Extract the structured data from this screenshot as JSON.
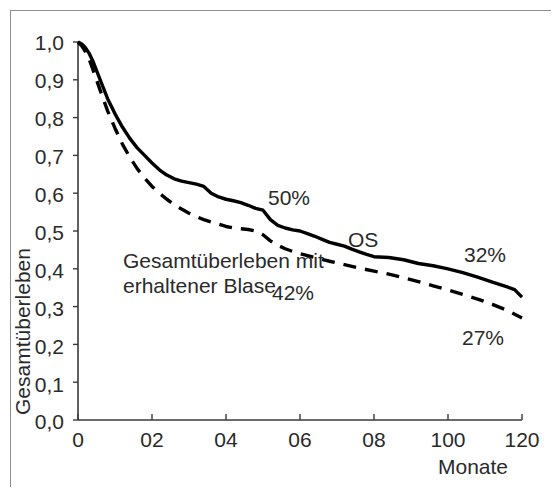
{
  "chart_data": {
    "type": "line",
    "title": "",
    "xlabel": "Monate",
    "ylabel": "Gesamtüberleben",
    "xlim": [
      0,
      120
    ],
    "ylim": [
      0.0,
      1.0
    ],
    "grid": false,
    "legend_position": "inline-annotations",
    "x_tick_labels": [
      "0",
      "02",
      "04",
      "06",
      "08",
      "100",
      "120"
    ],
    "x_tick_values": [
      0,
      20,
      40,
      60,
      80,
      100,
      120
    ],
    "y_tick_labels": [
      "1,0",
      "0,9",
      "0,8",
      "0,7",
      "0,6",
      "0,5",
      "0,4",
      "0,3",
      "0,2",
      "0,1",
      "0,0"
    ],
    "y_tick_values": [
      1.0,
      0.9,
      0.8,
      0.7,
      0.6,
      0.5,
      0.4,
      0.3,
      0.2,
      0.1,
      0.0
    ],
    "series": [
      {
        "name": "OS",
        "style": "solid",
        "color": "#000000",
        "x": [
          0,
          1,
          2,
          3,
          4,
          5,
          6,
          7,
          8,
          10,
          12,
          14,
          16,
          18,
          20,
          22,
          24,
          26,
          28,
          30,
          32,
          34,
          36,
          38,
          40,
          42,
          44,
          46,
          48,
          50,
          52,
          54,
          56,
          58,
          60,
          62,
          64,
          66,
          68,
          70,
          72,
          74,
          76,
          78,
          80,
          84,
          88,
          92,
          96,
          100,
          104,
          108,
          112,
          116,
          118,
          120
        ],
        "y": [
          1.0,
          0.995,
          0.985,
          0.97,
          0.95,
          0.925,
          0.9,
          0.875,
          0.85,
          0.81,
          0.775,
          0.745,
          0.72,
          0.7,
          0.68,
          0.662,
          0.648,
          0.638,
          0.632,
          0.628,
          0.624,
          0.618,
          0.6,
          0.59,
          0.584,
          0.58,
          0.575,
          0.568,
          0.56,
          0.555,
          0.53,
          0.515,
          0.508,
          0.503,
          0.5,
          0.493,
          0.486,
          0.478,
          0.47,
          0.465,
          0.46,
          0.452,
          0.445,
          0.438,
          0.432,
          0.43,
          0.424,
          0.414,
          0.408,
          0.4,
          0.39,
          0.378,
          0.365,
          0.352,
          0.345,
          0.325
        ],
        "endpoint_label": "32%"
      },
      {
        "name": "Gesamtüberleben mit erhaltener Blase",
        "style": "dashed",
        "color": "#000000",
        "x": [
          0,
          1,
          2,
          3,
          4,
          5,
          6,
          7,
          8,
          10,
          12,
          14,
          16,
          18,
          20,
          22,
          24,
          26,
          28,
          30,
          32,
          34,
          36,
          38,
          40,
          42,
          44,
          46,
          48,
          50,
          52,
          54,
          56,
          58,
          60,
          64,
          68,
          72,
          76,
          80,
          84,
          88,
          92,
          96,
          100,
          104,
          108,
          112,
          116,
          120
        ],
        "y": [
          1.0,
          0.99,
          0.975,
          0.955,
          0.928,
          0.9,
          0.872,
          0.845,
          0.818,
          0.772,
          0.73,
          0.695,
          0.665,
          0.64,
          0.618,
          0.6,
          0.584,
          0.57,
          0.558,
          0.547,
          0.538,
          0.53,
          0.524,
          0.518,
          0.512,
          0.508,
          0.506,
          0.504,
          0.5,
          0.49,
          0.474,
          0.462,
          0.453,
          0.446,
          0.44,
          0.43,
          0.42,
          0.411,
          0.402,
          0.394,
          0.386,
          0.376,
          0.366,
          0.355,
          0.344,
          0.332,
          0.32,
          0.306,
          0.29,
          0.27
        ],
        "endpoint_label": "27%"
      }
    ],
    "annotations": [
      {
        "id": "pct-50",
        "text": "50%",
        "x": 52,
        "y": 0.625
      },
      {
        "id": "series-label-os",
        "text": "OS",
        "x": 72,
        "y": 0.525
      },
      {
        "id": "pct-32",
        "text": "32%",
        "x": 104,
        "y": 0.49
      },
      {
        "id": "pct-42",
        "text": "42%",
        "x": 58,
        "y": 0.385
      },
      {
        "id": "pct-27",
        "text": "27%",
        "x": 104,
        "y": 0.26
      },
      {
        "id": "curve-label-preserved-bladder-line1",
        "text": "Gesamtüberleben mit",
        "x": 22,
        "y": 0.425
      },
      {
        "id": "curve-label-preserved-bladder-line2",
        "text": "erhaltener Blase",
        "x": 22,
        "y": 0.365
      }
    ]
  },
  "axis": {
    "x_title": "Monate",
    "y_title": "Gesamtüberleben",
    "x_ticks": [
      "0",
      "02",
      "04",
      "06",
      "08",
      "100",
      "120"
    ],
    "y_ticks": [
      "1,0",
      "0,9",
      "0,8",
      "0,7",
      "0,6",
      "0,5",
      "0,4",
      "0,3",
      "0,2",
      "0,1",
      "0,0"
    ]
  },
  "labels": {
    "pct_50": "50%",
    "pct_42": "42%",
    "pct_32": "32%",
    "pct_27": "27%",
    "os": "OS",
    "bladder_line1": "Gesamtüberleben mit",
    "bladder_line2": "erhaltener Blase"
  },
  "colors": {
    "axis": "#3a3a3a",
    "curve": "#000000",
    "frame": "#8d8d8d",
    "text": "#2a2a2a",
    "background": "#ffffff"
  }
}
